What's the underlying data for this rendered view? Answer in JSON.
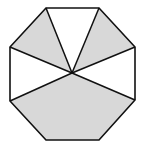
{
  "diagram": {
    "type": "regular-octagon-partition",
    "colors": {
      "shaded": "#d8d8d8",
      "unshaded": "#ffffff",
      "stroke": "#111111"
    },
    "center": [
      72,
      73
    ],
    "vertices": {
      "top_left": [
        46,
        8
      ],
      "top_right": [
        99,
        8
      ],
      "right_upper": [
        135,
        47
      ],
      "right_lower": [
        135,
        100
      ],
      "bottom_right": [
        99,
        140
      ],
      "bottom_left": [
        46,
        140
      ],
      "left_lower": [
        10,
        101
      ],
      "left_upper": [
        10,
        47
      ]
    },
    "regions": [
      {
        "name": "upper-left-triangle",
        "shaded": true
      },
      {
        "name": "top-triangle",
        "shaded": false
      },
      {
        "name": "upper-right-triangle",
        "shaded": true
      },
      {
        "name": "right-region",
        "shaded": false
      },
      {
        "name": "left-region",
        "shaded": false
      },
      {
        "name": "bottom-pentagon",
        "shaded": true
      }
    ]
  }
}
